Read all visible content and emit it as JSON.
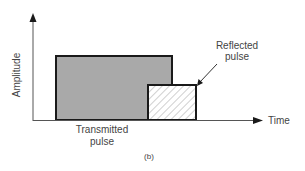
{
  "diagram": {
    "y_axis_label": "Amplitude",
    "x_axis_label": "Time",
    "transmitted_label_line1": "Transmitted",
    "transmitted_label_line2": "pulse",
    "reflected_label_line1": "Reflected",
    "reflected_label_line2": "pulse",
    "caption": "(b)",
    "colors": {
      "transmitted_fill": "#a9a9a9",
      "reflected_fill": "#ffffff",
      "hatch": "#8a8a8a",
      "stroke": "#1a1a1a",
      "axis": "#555555"
    }
  }
}
